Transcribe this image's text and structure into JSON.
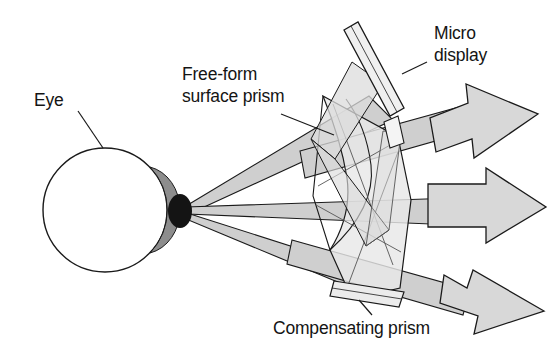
{
  "figure": {
    "type": "optical-schematic",
    "title_visible": false,
    "background_color": "#ffffff",
    "ink_color": "#141414"
  },
  "labels": {
    "eye": "Eye",
    "freeform_line1": "Free-form",
    "freeform_line2": "surface prism",
    "microdisplay_line1": "Micro",
    "microdisplay_line2": "display",
    "compensating": "Compensating prism"
  },
  "colors": {
    "outline": "#1a1a1a",
    "beam_fill": "#cfcfcf",
    "beam_fill_light": "#e2e2e2",
    "prism_fill": "#e8e8e8",
    "prism_fill_alt": "#dcdcdc",
    "arrow_fill": "#d8d8d8",
    "iris_gray": "#8d8d8d",
    "pupil_black": "#141414",
    "eye_white": "#ffffff"
  },
  "components": {
    "eye": {
      "name": "Eye",
      "center_x": 105,
      "center_y": 210,
      "radius": 62,
      "pupil_x": 186,
      "pupil_y": 210
    },
    "microdisplay": {
      "name": "Micro display",
      "tilt_degrees": 40
    },
    "freeform_prism": {
      "name": "Free-form surface prism"
    },
    "compensating_prism": {
      "name": "Compensating prism"
    },
    "exit_arrows": [
      {
        "id": "upper",
        "direction": "up-right"
      },
      {
        "id": "middle",
        "direction": "right"
      },
      {
        "id": "lower",
        "direction": "down-right"
      }
    ],
    "beams": [
      {
        "id": "upper-beam",
        "from": "pupil",
        "to": "prism-top"
      },
      {
        "id": "middle-beam",
        "from": "pupil",
        "to": "prism-middle"
      },
      {
        "id": "lower-beam",
        "from": "pupil",
        "to": "prism-bottom"
      }
    ]
  }
}
